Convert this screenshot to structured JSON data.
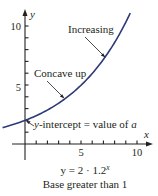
{
  "chart_data": {
    "type": "line",
    "title": "",
    "function": "y = 2 · 1.2^x",
    "xlabel": "x",
    "ylabel": "y",
    "xlim": [
      -2,
      11
    ],
    "ylim": [
      0,
      11
    ],
    "x_ticks": [
      1,
      2,
      3,
      4,
      5,
      6,
      7,
      8,
      9,
      10
    ],
    "x_tick_labels": [
      {
        "value": 5,
        "label": "5"
      },
      {
        "value": 10,
        "label": "10"
      }
    ],
    "y_ticks": [
      1,
      2,
      3,
      4,
      5,
      6,
      7,
      8,
      9,
      10
    ],
    "y_tick_labels": [
      {
        "value": 5,
        "label": "5"
      },
      {
        "value": 10,
        "label": "10"
      }
    ],
    "grid": false,
    "series": [
      {
        "name": "y = 2 · 1.2^x",
        "color": "#2e3a78",
        "x": [
          -2,
          -1,
          0,
          1,
          2,
          3,
          4,
          5,
          6,
          7,
          8,
          9,
          9.4
        ],
        "y": [
          1.39,
          1.67,
          2,
          2.4,
          2.88,
          3.46,
          4.15,
          4.98,
          5.97,
          7.17,
          8.6,
          10.32,
          11.1
        ]
      }
    ],
    "annotations": [
      {
        "text": "Increasing",
        "points_to": [
          8.2,
          8.0
        ]
      },
      {
        "text": "Concave up",
        "points_to": [
          3.5,
          4.0
        ]
      },
      {
        "text": "y-intercept = value of a",
        "points_to": [
          0,
          2
        ]
      }
    ]
  },
  "labels": {
    "y_axis": "y",
    "x_axis": "x",
    "tick_y_10": "10",
    "tick_y_5": "5",
    "tick_x_5": "5",
    "tick_x_10": "10",
    "increasing": "Increasing",
    "concave_up": "Concave up",
    "intercept_var": "y",
    "intercept_rest": "-intercept = value of ",
    "intercept_a": "a",
    "equation_main": "y = 2 · 1.2",
    "equation_exp": "x",
    "caption": "Base greater than 1"
  }
}
